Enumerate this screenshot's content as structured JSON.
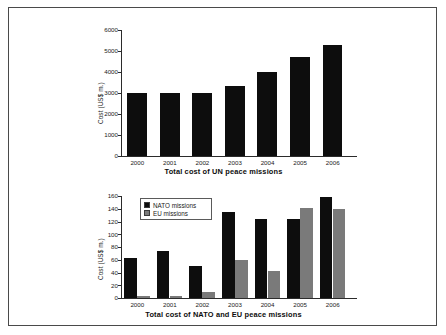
{
  "figure": {
    "border_color": "#4a4a4a",
    "background": "#ffffff"
  },
  "chart_data": [
    {
      "id": "un-chart",
      "type": "bar",
      "title": "Total cost of UN peace missions",
      "xlabel": "",
      "ylabel": "Cost (US$ m.)",
      "categories": [
        "2000",
        "2001",
        "2002",
        "2003",
        "2004",
        "2005",
        "2006"
      ],
      "values": [
        3020,
        3000,
        2980,
        3320,
        4000,
        4700,
        5300
      ],
      "ylim": [
        0,
        6000
      ],
      "yticks": [
        0,
        1000,
        2000,
        3000,
        4000,
        5000,
        6000
      ],
      "ytick_labels": [
        "0",
        "1000",
        "2000",
        "3000",
        "4000",
        "5000",
        "6000"
      ],
      "grid": false,
      "legend": false,
      "series_color": "#0d0d0d"
    },
    {
      "id": "nato-eu-chart",
      "type": "bar",
      "title": "Total cost of NATO and EU peace missions",
      "xlabel": "",
      "ylabel": "Cost (US$ m.)",
      "categories": [
        "2000",
        "2001",
        "2002",
        "2003",
        "2004",
        "2005",
        "2006"
      ],
      "series": [
        {
          "name": "NATO missions",
          "color": "#0d0d0d",
          "values": [
            62,
            74,
            50,
            135,
            124,
            124,
            158
          ]
        },
        {
          "name": "EU missions",
          "color": "#7a7a7a",
          "values": [
            3,
            3,
            9,
            60,
            43,
            141,
            140
          ]
        }
      ],
      "ylim": [
        0,
        160
      ],
      "yticks": [
        0,
        20,
        40,
        60,
        80,
        100,
        120,
        140,
        160
      ],
      "ytick_labels": [
        "0",
        "20",
        "40",
        "60",
        "80",
        "100",
        "120",
        "140",
        "160"
      ],
      "grid": false,
      "legend": true,
      "legend_position": "upper-left"
    }
  ]
}
